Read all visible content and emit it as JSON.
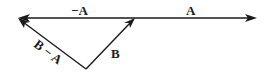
{
  "diagram": {
    "type": "vector-subtraction",
    "background": "#ffffff",
    "ink_color": "#1a1a1a",
    "labels": {
      "neg_a": "−A",
      "a": "A",
      "b": "B",
      "b_minus_a": "B − A"
    },
    "vectors": [
      {
        "name": "A",
        "from": [
          135,
          18
        ],
        "to": [
          256,
          18
        ]
      },
      {
        "name": "−A",
        "from": [
          135,
          18
        ],
        "to": [
          18,
          18
        ]
      },
      {
        "name": "B",
        "from": [
          86,
          69
        ],
        "to": [
          135,
          18
        ]
      },
      {
        "name": "B − A",
        "from": [
          86,
          69
        ],
        "to": [
          18,
          18
        ]
      }
    ]
  }
}
